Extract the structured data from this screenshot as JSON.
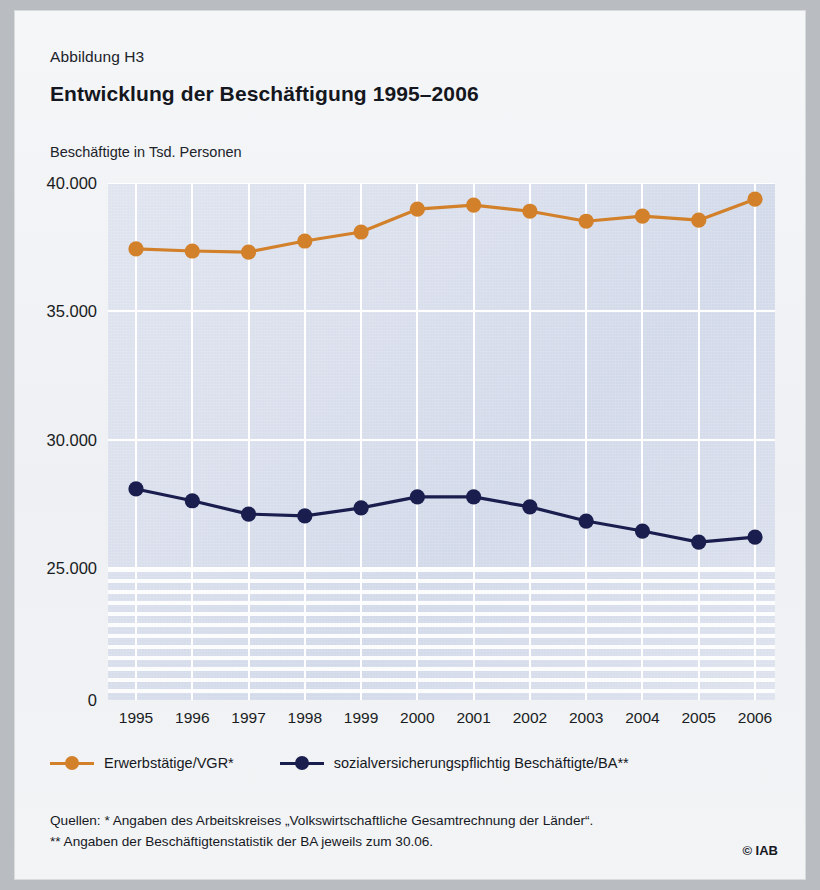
{
  "figure": {
    "label": "Abbildung H3",
    "title": "Entwicklung der Beschäftigung 1995–2006",
    "axis_caption": "Beschäftigte in Tsd. Personen"
  },
  "legend": {
    "items": [
      {
        "label": "Erwerbstätige/VGR*",
        "color": "#d2802a"
      },
      {
        "label": "sozialversicherungspflichtig Beschäftigte/BA**",
        "color": "#1a1e4e"
      }
    ]
  },
  "sources": {
    "line1": "Quellen: * Angaben des Arbeitskreises „Volkswirtschaftliche Gesamtrechnung der Länder“.",
    "line2": "** Angaben der Beschäftigtenstatistik der BA jeweils zum 30.06.",
    "copyright": "© IAB"
  },
  "chart_data": {
    "type": "line",
    "title": "Entwicklung der Beschäftigung 1995–2006",
    "subtitle": "Abbildung H3",
    "xlabel": "",
    "ylabel": "Beschäftigte in Tsd. Personen",
    "categories": [
      "1995",
      "1996",
      "1997",
      "1998",
      "1999",
      "2000",
      "2001",
      "2002",
      "2003",
      "2004",
      "2005",
      "2006"
    ],
    "ytick_labels": [
      "40.000",
      "35.000",
      "30.000",
      "25.000",
      "0"
    ],
    "ytick_values": [
      40000,
      35000,
      30000,
      25000,
      0
    ],
    "ylim": [
      25000,
      40000
    ],
    "axis_break_below": 25000,
    "grid": true,
    "legend_position": "bottom-left",
    "series": [
      {
        "name": "Erwerbstätige/VGR*",
        "color": "#d2802a",
        "values": [
          37430,
          37350,
          37310,
          37740,
          38090,
          38980,
          39140,
          38900,
          38510,
          38710,
          38550,
          39370
        ]
      },
      {
        "name": "sozialversicherungspflichtig Beschäftigte/BA**",
        "color": "#1a1e4e",
        "values": [
          28080,
          27620,
          27100,
          27030,
          27340,
          27770,
          27770,
          27380,
          26830,
          26440,
          26010,
          26200
        ]
      }
    ]
  }
}
